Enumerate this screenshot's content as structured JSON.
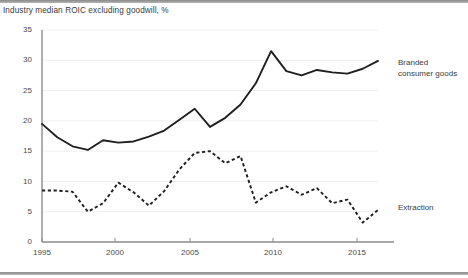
{
  "chart_data": {
    "type": "line",
    "title": "Industry median ROIC excluding goodwill, %",
    "xlabel": "",
    "ylabel": "",
    "xlim": [
      1995,
      2017
    ],
    "ylim": [
      0,
      35
    ],
    "ytick_values": [
      0,
      5,
      10,
      15,
      20,
      25,
      30,
      35
    ],
    "ytick_labels": [
      "0",
      "5",
      "10",
      "15",
      "20",
      "25",
      "30",
      "35"
    ],
    "xtick_values": [
      1995,
      2000,
      2005,
      2010,
      2015
    ],
    "xtick_labels": [
      "1995",
      "2000",
      "2005",
      "2010",
      "2015"
    ],
    "grid": true,
    "grid_axis": "y",
    "legend_position": "right-inline",
    "x": [
      1995,
      1996,
      1997,
      1998,
      1999,
      2000,
      2001,
      2002,
      2003,
      2004,
      2005,
      2006,
      2007,
      2008,
      2009,
      2010,
      2011,
      2012,
      2013,
      2014,
      2015,
      2016,
      2017
    ],
    "series": [
      {
        "name": "Branded consumer goods",
        "label": "Branded\nconsumer goods",
        "style": "solid",
        "color": "#1f1f1f",
        "values": [
          19.5,
          17.3,
          15.8,
          15.2,
          16.8,
          16.4,
          16.6,
          17.4,
          18.4,
          20.2,
          22.0,
          19.0,
          20.5,
          22.7,
          26.2,
          31.5,
          28.2,
          27.5,
          28.4,
          28.0,
          27.8,
          28.6,
          29.9
        ]
      },
      {
        "name": "Extraction",
        "label": "Extraction",
        "style": "dashed",
        "color": "#1f1f1f",
        "values": [
          8.5,
          8.5,
          8.3,
          5.0,
          6.4,
          9.8,
          8.2,
          6.0,
          8.4,
          12.0,
          14.7,
          15.0,
          13.0,
          14.2,
          6.5,
          8.2,
          9.2,
          7.8,
          8.9,
          6.4,
          7.0,
          3.2,
          5.3
        ]
      }
    ],
    "annotations": []
  },
  "axes_geometry": {
    "plot_left": 42,
    "plot_right": 378,
    "plot_top": 30,
    "plot_bottom": 242
  },
  "legend": {
    "branded_label": "Branded\nconsumer goods",
    "extraction_label": "Extraction"
  },
  "ticks": {
    "y": [
      "35",
      "30",
      "25",
      "20",
      "15",
      "10",
      "5",
      "0"
    ],
    "x": [
      "1995",
      "2000",
      "2005",
      "2010",
      "2015"
    ]
  }
}
